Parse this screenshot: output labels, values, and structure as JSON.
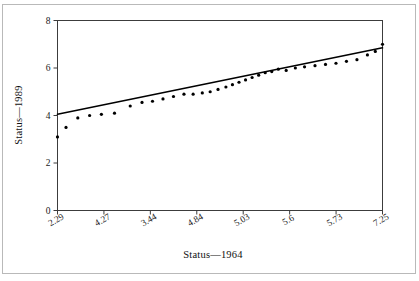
{
  "chart_data": {
    "type": "scatter",
    "title": "",
    "xlabel": "Status—1964",
    "ylabel": "Status—1989",
    "xlim": [
      2.29,
      7.25
    ],
    "ylim": [
      0,
      8
    ],
    "grid": false,
    "legend": null,
    "x_tick_labels": [
      "2.29",
      "4.27",
      "3.44",
      "4.84",
      "5.03",
      "5.6",
      "5.73",
      "7.25"
    ],
    "y_tick_labels": [
      "0",
      "2",
      "4",
      "6",
      "8"
    ],
    "y_ticks": [
      0,
      2,
      4,
      6,
      8
    ],
    "x_tick_label_rotation_deg": -30,
    "series": [
      {
        "name": "observed",
        "marker": "dot",
        "color": "#000000",
        "points": [
          [
            2.29,
            3.1
          ],
          [
            2.42,
            3.5
          ],
          [
            2.6,
            3.9
          ],
          [
            2.78,
            4.0
          ],
          [
            2.96,
            4.05
          ],
          [
            3.16,
            4.1
          ],
          [
            3.4,
            4.4
          ],
          [
            3.58,
            4.55
          ],
          [
            3.74,
            4.6
          ],
          [
            3.9,
            4.7
          ],
          [
            4.06,
            4.8
          ],
          [
            4.22,
            4.9
          ],
          [
            4.36,
            4.9
          ],
          [
            4.5,
            4.95
          ],
          [
            4.62,
            5.0
          ],
          [
            4.74,
            5.1
          ],
          [
            4.86,
            5.2
          ],
          [
            4.96,
            5.3
          ],
          [
            5.06,
            5.4
          ],
          [
            5.16,
            5.5
          ],
          [
            5.26,
            5.6
          ],
          [
            5.36,
            5.7
          ],
          [
            5.46,
            5.8
          ],
          [
            5.56,
            5.85
          ],
          [
            5.66,
            5.95
          ],
          [
            5.78,
            5.9
          ],
          [
            5.92,
            6.0
          ],
          [
            6.06,
            6.05
          ],
          [
            6.22,
            6.1
          ],
          [
            6.38,
            6.15
          ],
          [
            6.54,
            6.2
          ],
          [
            6.7,
            6.28
          ],
          [
            6.86,
            6.35
          ],
          [
            7.02,
            6.55
          ],
          [
            7.14,
            6.7
          ],
          [
            7.25,
            7.0
          ]
        ]
      }
    ],
    "fit_line": {
      "name": "regression line",
      "color": "#000000",
      "x_start": 2.29,
      "y_start": 4.05,
      "x_end": 7.25,
      "y_end": 6.85
    }
  },
  "figure": {
    "background_color": "#ffffff",
    "frame_color": "#b9b9b9",
    "axis_color": "#3c3c3c"
  }
}
